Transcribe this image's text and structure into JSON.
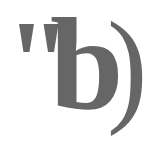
{
  "label": {
    "quote": "\"",
    "letter": "b",
    "paren": ")",
    "full_text": "\"b)"
  },
  "colors": {
    "text": "#666666",
    "background": "#ffffff"
  }
}
